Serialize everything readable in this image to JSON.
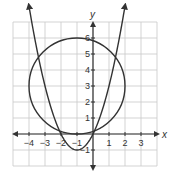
{
  "diagram": {
    "type": "coordinate-plane",
    "x_axis_label": "x",
    "y_axis_label": "y",
    "x_range": [
      -5,
      4
    ],
    "y_range": [
      -2,
      7
    ],
    "grid_step": 1,
    "x_ticks": [
      {
        "value": -4,
        "label": "-4"
      },
      {
        "value": -3,
        "label": "-3"
      },
      {
        "value": -2,
        "label": "-2"
      },
      {
        "value": -1,
        "label": "-1"
      },
      {
        "value": 1,
        "label": "1"
      },
      {
        "value": 2,
        "label": "2"
      },
      {
        "value": 3,
        "label": "3"
      }
    ],
    "y_ticks": [
      {
        "value": -1,
        "label": "-1"
      },
      {
        "value": 1,
        "label": "1"
      },
      {
        "value": 2,
        "label": "2"
      },
      {
        "value": 3,
        "label": "3"
      },
      {
        "value": 4,
        "label": "4"
      },
      {
        "value": 5,
        "label": "5"
      },
      {
        "value": 6,
        "label": "6"
      }
    ],
    "curves": [
      {
        "name": "parabola",
        "equation": "y = x^2 + 2x",
        "vertex": [
          -1,
          -1
        ],
        "x_intercepts": [
          -2,
          0
        ],
        "arrows": true
      },
      {
        "name": "circle",
        "center": [
          -1,
          3
        ],
        "radius": 3
      }
    ],
    "colors": {
      "grid": "#c8c8c8",
      "axis": "#333333",
      "curve": "#333333"
    }
  }
}
